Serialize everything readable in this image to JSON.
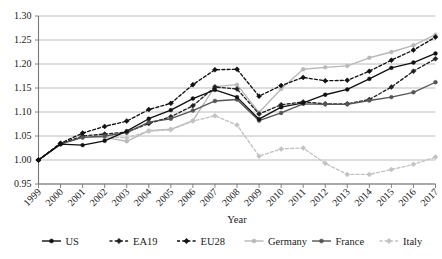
{
  "chart_data": {
    "type": "line",
    "title": "",
    "xlabel": "Year",
    "ylabel": "",
    "x": [
      1999,
      2000,
      2001,
      2002,
      2003,
      2004,
      2005,
      2006,
      2007,
      2008,
      2009,
      2010,
      2011,
      2012,
      2013,
      2014,
      2015,
      2016,
      2017
    ],
    "xticklabels": [
      "1999",
      "2000",
      "2001",
      "2002",
      "2003",
      "2004",
      "2005",
      "2006",
      "2007",
      "2008",
      "2009",
      "2010",
      "2011",
      "2012",
      "2013",
      "2014",
      "2015",
      "2016",
      "2017"
    ],
    "yticklabels": [
      "0.95",
      "1.00",
      "1.05",
      "1.10",
      "1.15",
      "1.20",
      "1.25",
      "1.30"
    ],
    "yticks": [
      0.95,
      1.0,
      1.05,
      1.1,
      1.15,
      1.2,
      1.25,
      1.3
    ],
    "ylim": [
      0.95,
      1.3
    ],
    "xlim": [
      1999,
      2017
    ],
    "grid": "horizontal",
    "legend_position": "bottom",
    "series": [
      {
        "name": "US",
        "color": "#111111",
        "dash": "solid",
        "marker": "circle",
        "values": [
          1.0,
          1.033,
          1.031,
          1.04,
          1.06,
          1.086,
          1.104,
          1.128,
          1.146,
          1.131,
          1.085,
          1.11,
          1.119,
          1.136,
          1.147,
          1.169,
          1.192,
          1.203,
          1.222
        ]
      },
      {
        "name": "EA19",
        "color": "#222222",
        "dash": "dashed",
        "marker": "diamond",
        "values": [
          1.0,
          1.034,
          1.05,
          1.054,
          1.058,
          1.076,
          1.09,
          1.113,
          1.152,
          1.148,
          1.096,
          1.115,
          1.121,
          1.117,
          1.117,
          1.126,
          1.152,
          1.185,
          1.211
        ]
      },
      {
        "name": "EU28",
        "color": "#111111",
        "dash": "dashed",
        "marker": "diamond",
        "values": [
          1.0,
          1.035,
          1.056,
          1.07,
          1.081,
          1.105,
          1.118,
          1.157,
          1.188,
          1.189,
          1.133,
          1.155,
          1.172,
          1.165,
          1.166,
          1.185,
          1.208,
          1.229,
          1.256
        ]
      },
      {
        "name": "Germany",
        "color": "#b8b8b8",
        "dash": "solid",
        "marker": "circle",
        "values": [
          1.0,
          1.034,
          1.048,
          1.047,
          1.039,
          1.061,
          1.064,
          1.082,
          1.153,
          1.157,
          1.099,
          1.148,
          1.189,
          1.193,
          1.196,
          1.213,
          1.225,
          1.239,
          1.261
        ]
      },
      {
        "name": "France",
        "color": "#555555",
        "dash": "solid",
        "marker": "circle",
        "values": [
          1.0,
          1.033,
          1.047,
          1.05,
          1.057,
          1.079,
          1.086,
          1.103,
          1.123,
          1.126,
          1.082,
          1.098,
          1.117,
          1.116,
          1.116,
          1.124,
          1.131,
          1.141,
          1.162
        ]
      },
      {
        "name": "Italy",
        "color": "#c2c2c2",
        "dash": "dashed",
        "marker": "diamond",
        "values": [
          1.0,
          1.033,
          1.047,
          1.049,
          1.046,
          1.06,
          1.063,
          1.081,
          1.092,
          1.073,
          1.008,
          1.023,
          1.025,
          0.993,
          0.97,
          0.97,
          0.98,
          0.991,
          1.006
        ]
      }
    ]
  },
  "legend": {
    "items": [
      {
        "label": "US"
      },
      {
        "label": "EA19"
      },
      {
        "label": "EU28"
      },
      {
        "label": "Germany"
      },
      {
        "label": "France"
      },
      {
        "label": "Italy"
      }
    ]
  },
  "axis": {
    "x_title": "Year"
  }
}
